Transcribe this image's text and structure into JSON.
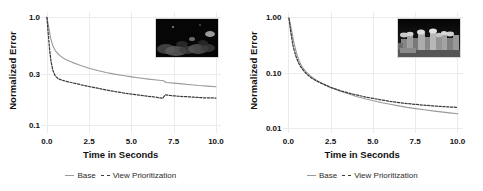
{
  "figure": {
    "panels": [
      {
        "id": "left",
        "axis": {
          "ylabel": "Normalized Error",
          "xlabel": "Time in Seconds",
          "yticks": [
            "1.0",
            "0.3",
            "0.1"
          ],
          "ytick_values": [
            1.0,
            0.3,
            0.1
          ],
          "xticks": [
            "0.0",
            "2.5",
            "5.0",
            "7.5",
            "10.0"
          ],
          "xtick_values": [
            0.0,
            2.5,
            5.0,
            7.5,
            10.0
          ]
        },
        "legend": {
          "solid_label": "Base",
          "dashed_label": "View Prioritization"
        },
        "inset": {
          "name": "dark-night-scene-thumbnail",
          "description": "very dark night scene, faint gray blobs"
        }
      },
      {
        "id": "right",
        "axis": {
          "ylabel": "Normalized Error",
          "xlabel": "Time in Seconds",
          "yticks": [
            "1.00",
            "0.10",
            "0.01"
          ],
          "ytick_values": [
            1.0,
            0.1,
            0.01
          ],
          "xticks": [
            "0.0",
            "2.5",
            "5.0",
            "7.5",
            "10.0"
          ],
          "xtick_values": [
            0.0,
            2.5,
            5.0,
            7.5,
            10.0
          ]
        },
        "legend": {
          "solid_label": "Base",
          "dashed_label": "View Prioritization"
        },
        "inset": {
          "name": "grayscale-rocky-village-thumbnail",
          "description": "grayscale cluster of bright rocky/building shapes on black"
        }
      }
    ]
  },
  "chart_data": [
    {
      "type": "line",
      "title": "",
      "xlabel": "Time in Seconds",
      "ylabel": "Normalized Error",
      "yscale": "log",
      "xlim": [
        -0.35,
        10.3
      ],
      "ylim": [
        0.085,
        1.12
      ],
      "grid": true,
      "legend_position": "bottom",
      "xticks": [
        0.0,
        2.5,
        5.0,
        7.5,
        10.0
      ],
      "yticks": [
        1.0,
        0.3,
        0.1
      ],
      "series": [
        {
          "name": "Base",
          "style": "solid",
          "color": "#9a9a9a",
          "x": [
            0.0,
            0.1,
            0.2,
            0.35,
            0.5,
            0.75,
            1.0,
            1.25,
            1.5,
            2.0,
            2.5,
            3.0,
            3.5,
            4.0,
            4.5,
            5.0,
            5.5,
            6.0,
            6.5,
            6.9,
            7.05,
            7.5,
            8.0,
            8.5,
            9.0,
            9.5,
            10.0
          ],
          "y": [
            1.0,
            0.83,
            0.66,
            0.545,
            0.49,
            0.445,
            0.415,
            0.398,
            0.383,
            0.358,
            0.338,
            0.322,
            0.309,
            0.298,
            0.289,
            0.281,
            0.274,
            0.268,
            0.263,
            0.259,
            0.249,
            0.246,
            0.242,
            0.238,
            0.234,
            0.231,
            0.228
          ]
        },
        {
          "name": "View Prioritization",
          "style": "dashed",
          "color": "#3a3a3a",
          "x": [
            0.0,
            0.08,
            0.16,
            0.25,
            0.35,
            0.5,
            0.7,
            1.0,
            1.25,
            1.5,
            2.0,
            2.5,
            3.0,
            3.5,
            4.0,
            4.5,
            5.0,
            5.5,
            6.0,
            6.5,
            6.85,
            7.0,
            7.3,
            7.8,
            8.3,
            8.8,
            9.3,
            10.0
          ],
          "y": [
            1.0,
            0.7,
            0.5,
            0.385,
            0.325,
            0.285,
            0.268,
            0.259,
            0.253,
            0.248,
            0.238,
            0.229,
            0.221,
            0.213,
            0.206,
            0.2,
            0.195,
            0.19,
            0.186,
            0.182,
            0.178,
            0.192,
            0.189,
            0.186,
            0.184,
            0.182,
            0.18,
            0.179
          ]
        }
      ]
    },
    {
      "type": "line",
      "title": "",
      "xlabel": "Time in Seconds",
      "ylabel": "Normalized Error",
      "yscale": "log",
      "xlim": [
        -0.35,
        10.3
      ],
      "ylim": [
        0.0082,
        1.25
      ],
      "grid": true,
      "legend_position": "bottom",
      "xticks": [
        0.0,
        2.5,
        5.0,
        7.5,
        10.0
      ],
      "yticks": [
        1.0,
        0.1,
        0.01
      ],
      "series": [
        {
          "name": "Base",
          "style": "solid",
          "color": "#9a9a9a",
          "x": [
            0.0,
            0.15,
            0.3,
            0.45,
            0.6,
            0.8,
            1.0,
            1.25,
            1.5,
            1.75,
            2.0,
            2.5,
            3.0,
            3.5,
            4.0,
            4.5,
            5.0,
            5.5,
            6.0,
            6.5,
            7.0,
            7.5,
            8.0,
            8.5,
            9.0,
            9.5,
            10.0
          ],
          "y": [
            1.0,
            0.6,
            0.345,
            0.225,
            0.165,
            0.125,
            0.105,
            0.089,
            0.078,
            0.07,
            0.064,
            0.054,
            0.047,
            0.042,
            0.0375,
            0.034,
            0.0312,
            0.0289,
            0.027,
            0.0253,
            0.0238,
            0.0226,
            0.0215,
            0.0206,
            0.0197,
            0.0189,
            0.0182
          ]
        },
        {
          "name": "View Prioritization",
          "style": "dashed",
          "color": "#3a3a3a",
          "x": [
            0.0,
            0.12,
            0.25,
            0.4,
            0.55,
            0.7,
            0.9,
            1.1,
            1.35,
            1.6,
            2.0,
            2.5,
            3.0,
            3.5,
            4.0,
            4.5,
            5.0,
            5.5,
            6.0,
            6.5,
            7.0,
            7.5,
            8.0,
            8.5,
            9.0,
            9.5,
            10.0
          ],
          "y": [
            0.96,
            0.52,
            0.3,
            0.205,
            0.155,
            0.128,
            0.106,
            0.092,
            0.08,
            0.072,
            0.063,
            0.054,
            0.048,
            0.0435,
            0.0398,
            0.0368,
            0.0344,
            0.0323,
            0.0305,
            0.0291,
            0.0279,
            0.0269,
            0.026,
            0.0253,
            0.0247,
            0.0242,
            0.0237
          ]
        }
      ]
    }
  ]
}
